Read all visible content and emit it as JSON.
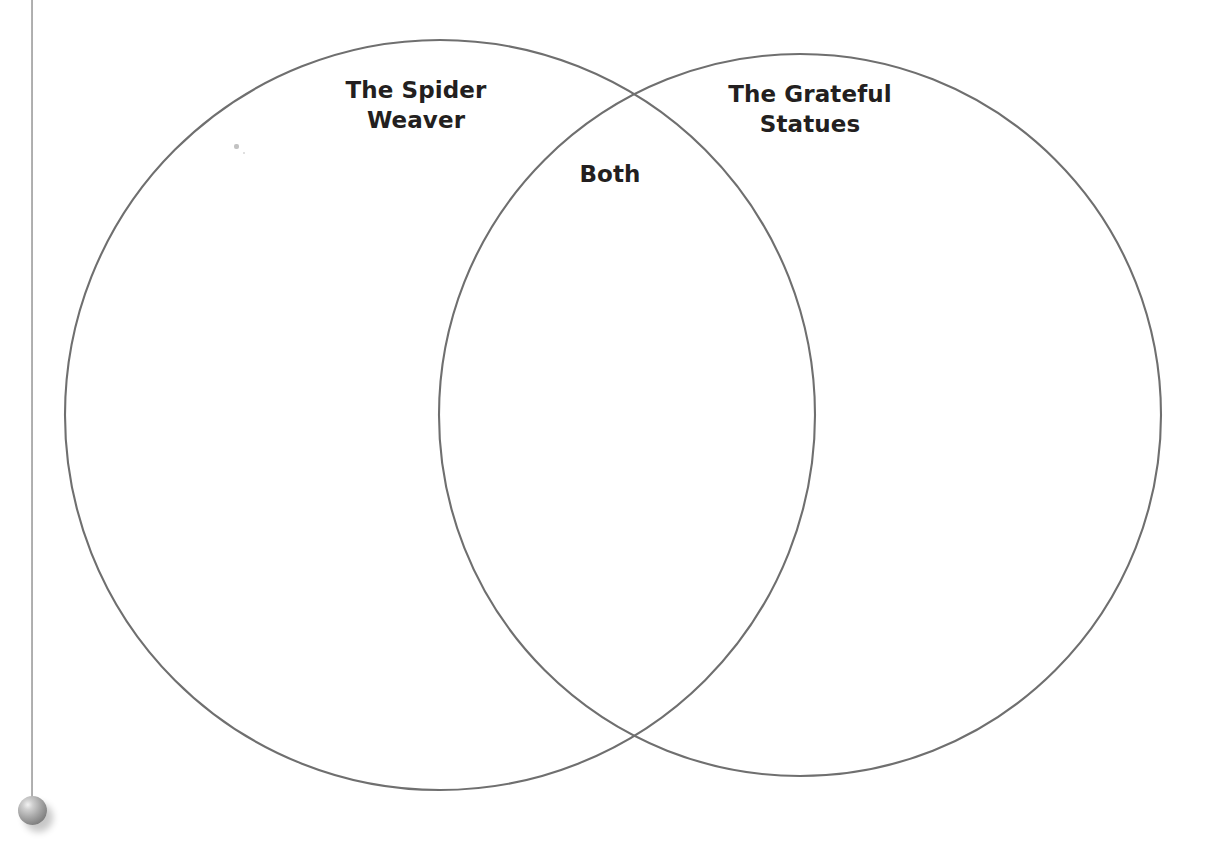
{
  "document": {
    "type": "venn-diagram-worksheet",
    "background_color": "#ffffff",
    "stroke_color": "#6f6f6f",
    "text_color": "#231f20"
  },
  "diagram": {
    "title_left": "The Spider\nWeaver",
    "title_right": "The Grateful\nStatues",
    "title_overlap": "Both",
    "left_circle": {
      "center_x": 440,
      "center_y": 415,
      "radius": 375
    },
    "right_circle": {
      "center_x": 800,
      "center_y": 415,
      "radius": 361
    },
    "stroke_width": 2
  },
  "margin_graphic": {
    "name": "plumb-line-with-bob",
    "line_x": 31,
    "bob_center_x": 32,
    "bob_center_y": 810,
    "bob_radius": 14
  }
}
